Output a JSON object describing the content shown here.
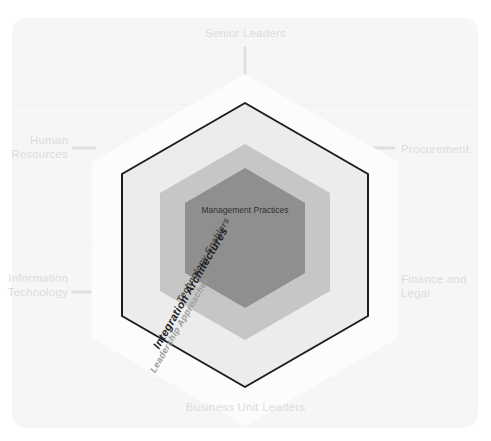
{
  "diagram": {
    "rings": [
      {
        "id": "leadership-approaches",
        "label": "Leadership Approaches",
        "fill": "#fbfbfb",
        "stroke": "none",
        "text_color": "#9a9a9a"
      },
      {
        "id": "integration-architectures",
        "label": "Integration Architectures",
        "fill": "#ededed",
        "stroke": "#1c1c1c",
        "text_color": "#1c1c1c"
      },
      {
        "id": "technology-enablers",
        "label": "Technology Enablers",
        "fill": "#c6c6c6",
        "stroke": "none",
        "text_color": "#4a4a4a"
      },
      {
        "id": "management-practices",
        "label": "Management Practices",
        "fill": "#8f8f8f",
        "stroke": "none",
        "text_color": "#2f2f2f"
      }
    ],
    "spokes": [
      {
        "id": "senior-leaders",
        "label": "Senior Leaders",
        "position": "top"
      },
      {
        "id": "procurement",
        "label": "Procurement",
        "position": "right-upper"
      },
      {
        "id": "finance-and-legal",
        "label": "Finance and\nLegal",
        "position": "right-lower"
      },
      {
        "id": "business-unit-leaders",
        "label": "Business Unit Leaders",
        "position": "bottom"
      },
      {
        "id": "information-technology",
        "label": "Information\nTechnology",
        "position": "left-lower"
      },
      {
        "id": "human-resources",
        "label": "Human\nResources",
        "position": "left-upper"
      }
    ],
    "colors": {
      "background": "#ffffff",
      "panel": "#f6f6f6",
      "spoke_text": "#dcdcdc",
      "connector": "#dedede",
      "outline": "#1c1c1c"
    }
  }
}
